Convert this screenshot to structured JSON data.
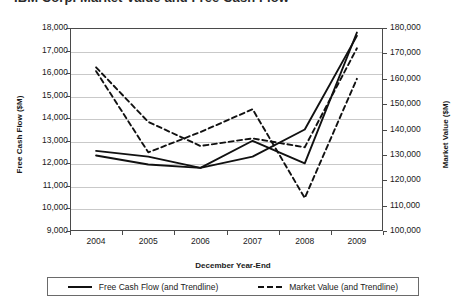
{
  "chart_data": {
    "type": "line",
    "title": "IBM Corp. Market Value and Free Cash Flow",
    "xlabel": "December Year-End",
    "ylabel": "Free Cash Flow ($M)",
    "y2label": "Market Value ($M)",
    "categories": [
      "2004",
      "2005",
      "2006",
      "2007",
      "2008",
      "2009"
    ],
    "x": [
      2004,
      2005,
      2006,
      2007,
      2008,
      2009
    ],
    "ylim": [
      9000,
      18000
    ],
    "y2lim": [
      100000,
      180000
    ],
    "yticks": [
      "9,000",
      "10,000",
      "11,000",
      "12,000",
      "13,000",
      "14,000",
      "15,000",
      "16,000",
      "17,000",
      "18,000"
    ],
    "ytick_values": [
      9000,
      10000,
      11000,
      12000,
      13000,
      14000,
      15000,
      16000,
      17000,
      18000
    ],
    "y2ticks": [
      "100,000",
      "110,000",
      "120,000",
      "130,000",
      "140,000",
      "150,000",
      "160,000",
      "170,000",
      "180,000"
    ],
    "y2tick_values": [
      100000,
      110000,
      120000,
      130000,
      140000,
      150000,
      160000,
      170000,
      180000
    ],
    "grid": true,
    "legend_position": "bottom",
    "series": [
      {
        "name": "Free Cash Flow (and Trendline)",
        "axis": "left",
        "style": "solid",
        "color": "#111111",
        "values": [
          12550,
          12300,
          11800,
          13000,
          12000,
          17800
        ]
      },
      {
        "name": "Free Cash Flow trendline",
        "axis": "left",
        "style": "solid",
        "color": "#111111",
        "trendline": true,
        "values": [
          12350,
          11950,
          11800,
          12300,
          13500,
          17650
        ]
      },
      {
        "name": "Market Value (and Trendline)",
        "axis": "right",
        "style": "dashed",
        "color": "#111111",
        "values": [
          163000,
          131000,
          139000,
          148000,
          113000,
          160000
        ]
      },
      {
        "name": "Market Value trendline",
        "axis": "right",
        "style": "dashed",
        "color": "#111111",
        "trendline": true,
        "values": [
          164500,
          143000,
          133500,
          136500,
          133000,
          172000
        ]
      }
    ]
  },
  "legend": {
    "items": [
      {
        "label": "Free Cash Flow (and Trendline)",
        "style": "solid"
      },
      {
        "label": "Market Value (and Trendline)",
        "style": "dashed"
      }
    ]
  }
}
